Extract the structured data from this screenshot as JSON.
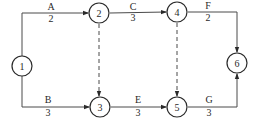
{
  "diagram": {
    "type": "activity-on-arrow network",
    "nodes": [
      {
        "id": "1",
        "label": "1"
      },
      {
        "id": "2",
        "label": "2"
      },
      {
        "id": "3",
        "label": "3"
      },
      {
        "id": "4",
        "label": "4"
      },
      {
        "id": "5",
        "label": "5"
      },
      {
        "id": "6",
        "label": "6"
      }
    ],
    "activities": [
      {
        "name": "A",
        "duration": "2",
        "from": "1",
        "to": "2"
      },
      {
        "name": "B",
        "duration": "3",
        "from": "1",
        "to": "3"
      },
      {
        "name": "C",
        "duration": "3",
        "from": "2",
        "to": "4"
      },
      {
        "name": "E",
        "duration": "3",
        "from": "3",
        "to": "5"
      },
      {
        "name": "F",
        "duration": "2",
        "from": "4",
        "to": "6"
      },
      {
        "name": "G",
        "duration": "3",
        "from": "5",
        "to": "6"
      }
    ],
    "dummies": [
      {
        "from": "2",
        "to": "3"
      },
      {
        "from": "4",
        "to": "5"
      }
    ]
  }
}
